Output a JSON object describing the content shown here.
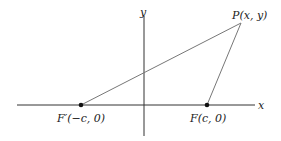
{
  "diagram": {
    "axes": {
      "x_label": "x",
      "y_label": "y",
      "axis_color": "#333333"
    },
    "points": {
      "F_prime": {
        "label": "F′(−c, 0)"
      },
      "F": {
        "label": "F(c, 0)"
      },
      "P": {
        "label": "P(x, y)"
      }
    },
    "segments": [
      {
        "from": "F_prime",
        "to": "P"
      },
      {
        "from": "F",
        "to": "P"
      }
    ],
    "line_color": "#777777",
    "point_color": "#111111"
  }
}
